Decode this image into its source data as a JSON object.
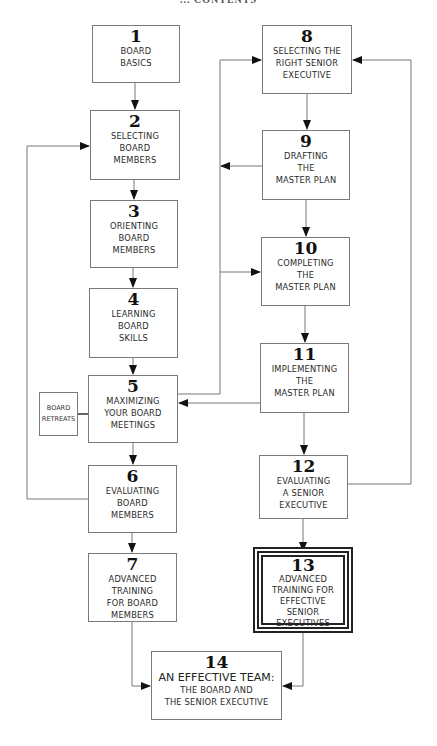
{
  "header": {
    "title": "... CONTENTS"
  },
  "diagram": {
    "type": "flowchart",
    "boxes": [
      {
        "id": 1,
        "number": "1",
        "lines": [
          "BOARD",
          "BASICS"
        ]
      },
      {
        "id": 2,
        "number": "2",
        "lines": [
          "SELECTING",
          "BOARD",
          "MEMBERS"
        ]
      },
      {
        "id": 3,
        "number": "3",
        "lines": [
          "ORIENTING",
          "BOARD",
          "MEMBERS"
        ]
      },
      {
        "id": 4,
        "number": "4",
        "lines": [
          "LEARNING",
          "BOARD",
          "SKILLS"
        ]
      },
      {
        "id": 5,
        "number": "5",
        "lines": [
          "MAXIMIZING",
          "YOUR BOARD",
          "MEETINGS"
        ]
      },
      {
        "id": 6,
        "number": "6",
        "lines": [
          "EVALUATING",
          "BOARD",
          "MEMBERS"
        ]
      },
      {
        "id": 7,
        "number": "7",
        "lines": [
          "ADVANCED",
          "TRAINING",
          "FOR BOARD",
          "MEMBERS"
        ]
      },
      {
        "id": 8,
        "number": "8",
        "lines": [
          "SELECTING THE",
          "RIGHT SENIOR",
          "EXECUTIVE"
        ]
      },
      {
        "id": 9,
        "number": "9",
        "lines": [
          "DRAFTING",
          "THE",
          "MASTER PLAN"
        ]
      },
      {
        "id": 10,
        "number": "10",
        "lines": [
          "COMPLETING",
          "THE",
          "MASTER PLAN"
        ]
      },
      {
        "id": 11,
        "number": "11",
        "lines": [
          "IMPLEMENTING",
          "THE",
          "MASTER PLAN"
        ]
      },
      {
        "id": 12,
        "number": "12",
        "lines": [
          "EVALUATING",
          "A SENIOR",
          "EXECUTIVE"
        ]
      },
      {
        "id": 13,
        "number": "13",
        "lines": [
          "ADVANCED",
          "TRAINING FOR",
          "EFFECTIVE SENIOR",
          "EXECUTIVES"
        ]
      },
      {
        "id": 14,
        "number": "14",
        "lines": [
          "AN EFFECTIVE TEAM:",
          "THE BOARD AND",
          "THE SENIOR EXECUTIVE"
        ]
      }
    ],
    "side_note": {
      "lines": [
        "BOARD",
        "RETREATS"
      ],
      "attached_to": 5
    },
    "edges": [
      {
        "from": 1,
        "to": 2
      },
      {
        "from": 2,
        "to": 3
      },
      {
        "from": 3,
        "to": 4
      },
      {
        "from": 4,
        "to": 5
      },
      {
        "from": 5,
        "to": 6
      },
      {
        "from": 6,
        "to": 7
      },
      {
        "from": 7,
        "to": 14
      },
      {
        "from": 5,
        "to": 8
      },
      {
        "from": 8,
        "to": 9
      },
      {
        "from": 9,
        "to": 10
      },
      {
        "from": 10,
        "to": 11
      },
      {
        "from": 11,
        "to": 12
      },
      {
        "from": 12,
        "to": 13
      },
      {
        "from": 13,
        "to": 14
      },
      {
        "from": 9,
        "to": 5
      },
      {
        "from": 5,
        "to": 10
      },
      {
        "from": 11,
        "to": 5
      },
      {
        "from": 12,
        "to": 8
      },
      {
        "from": 6,
        "to": 2
      }
    ]
  }
}
